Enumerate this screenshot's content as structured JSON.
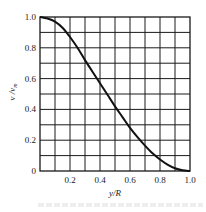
{
  "chart_data": {
    "type": "line",
    "title": "",
    "xlabel": "y/R",
    "ylabel": "v / v_m",
    "ylabel_main": "v /v",
    "ylabel_sub": "m",
    "xlim": [
      0,
      1.0
    ],
    "ylim": [
      0,
      1.0
    ],
    "grid": true,
    "grid_step_x": 0.1,
    "grid_step_y": 0.1,
    "x_ticks": [
      "",
      "0.2",
      "0.4",
      "0.6",
      "0.8",
      "1.0"
    ],
    "x_tick_values": [
      0,
      0.2,
      0.4,
      0.6,
      0.8,
      1.0
    ],
    "y_ticks": [
      "0",
      "0.2",
      "0.4",
      "0.6",
      "0.8",
      "1.0"
    ],
    "y_tick_values": [
      0,
      0.2,
      0.4,
      0.6,
      0.8,
      1.0
    ],
    "series": [
      {
        "name": "velocity profile",
        "x": [
          0,
          0.05,
          0.1,
          0.15,
          0.2,
          0.25,
          0.3,
          0.35,
          0.4,
          0.45,
          0.5,
          0.55,
          0.6,
          0.65,
          0.7,
          0.75,
          0.8,
          0.85,
          0.9,
          0.95,
          1.0
        ],
        "values": [
          1.0,
          0.99,
          0.97,
          0.93,
          0.87,
          0.8,
          0.72,
          0.645,
          0.57,
          0.495,
          0.42,
          0.35,
          0.28,
          0.22,
          0.165,
          0.115,
          0.075,
          0.042,
          0.018,
          0.005,
          0.0
        ]
      }
    ],
    "legend": null
  },
  "colors": {
    "line": "#111111",
    "grid": "#1a1a1a",
    "background": "#ffffff"
  }
}
